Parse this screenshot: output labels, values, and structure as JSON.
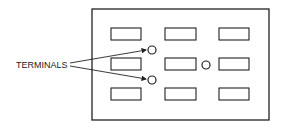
{
  "diagram": {
    "label": "TERMINALS",
    "colors": {
      "stroke": "#222222",
      "background": "#ffffff"
    },
    "panel": {
      "x": 92,
      "y": 9,
      "w": 177,
      "h": 111
    },
    "slots": [
      {
        "x": 111,
        "y": 28
      },
      {
        "x": 165,
        "y": 28
      },
      {
        "x": 219,
        "y": 28
      },
      {
        "x": 111,
        "y": 58
      },
      {
        "x": 165,
        "y": 58
      },
      {
        "x": 219,
        "y": 58
      },
      {
        "x": 111,
        "y": 88
      },
      {
        "x": 165,
        "y": 88
      },
      {
        "x": 219,
        "y": 88
      }
    ],
    "terminals": [
      {
        "cx": 152,
        "cy": 50,
        "labeled": true
      },
      {
        "cx": 152,
        "cy": 80,
        "labeled": true
      },
      {
        "cx": 206,
        "cy": 65,
        "labeled": false
      }
    ]
  }
}
